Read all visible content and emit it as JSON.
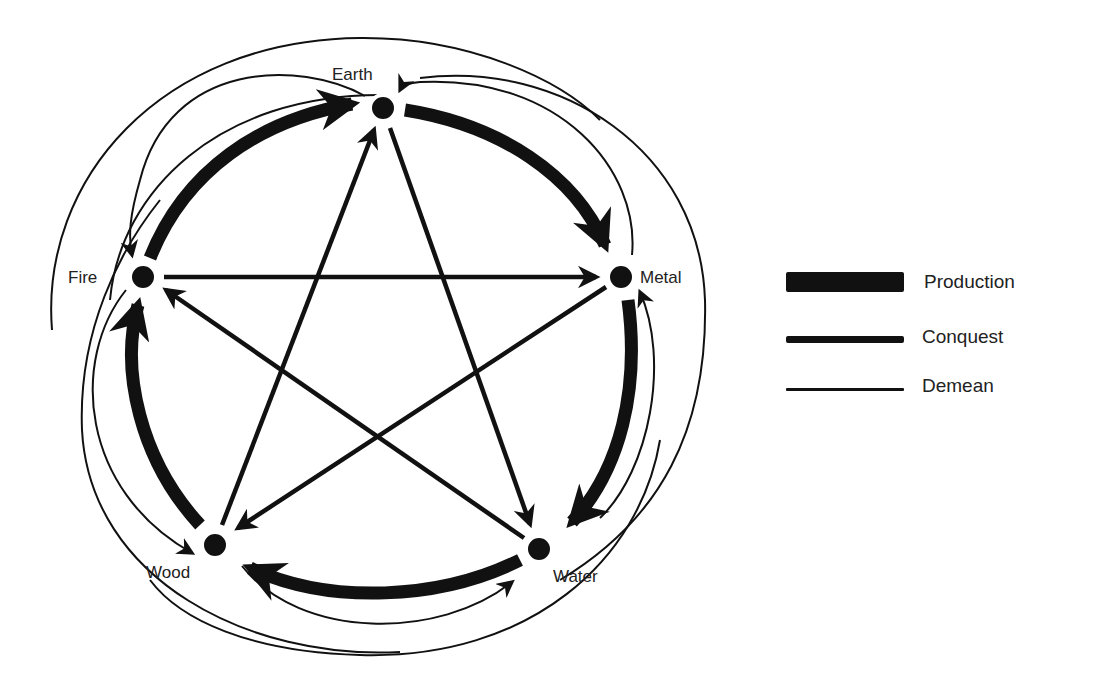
{
  "diagram": {
    "nodes": [
      {
        "id": "earth",
        "label": "Earth",
        "x": 383,
        "y": 108
      },
      {
        "id": "metal",
        "label": "Metal",
        "x": 621,
        "y": 277
      },
      {
        "id": "water",
        "label": "Water",
        "x": 539,
        "y": 549
      },
      {
        "id": "wood",
        "label": "Wood",
        "x": 215,
        "y": 545
      },
      {
        "id": "fire",
        "label": "Fire",
        "x": 143,
        "y": 277
      }
    ],
    "edges": {
      "production": [
        {
          "from": "Earth",
          "to": "Metal"
        },
        {
          "from": "Metal",
          "to": "Water"
        },
        {
          "from": "Water",
          "to": "Wood"
        },
        {
          "from": "Wood",
          "to": "Fire"
        },
        {
          "from": "Fire",
          "to": "Earth"
        }
      ],
      "conquest": [
        {
          "from": "Earth",
          "to": "Water"
        },
        {
          "from": "Water",
          "to": "Fire"
        },
        {
          "from": "Fire",
          "to": "Metal"
        },
        {
          "from": "Metal",
          "to": "Wood"
        },
        {
          "from": "Wood",
          "to": "Earth"
        }
      ],
      "demean": [
        {
          "from": "Earth",
          "to": "Fire"
        },
        {
          "from": "Fire",
          "to": "Wood"
        },
        {
          "from": "Wood",
          "to": "Water"
        },
        {
          "from": "Water",
          "to": "Metal"
        },
        {
          "from": "Metal",
          "to": "Earth"
        }
      ]
    }
  },
  "legend": {
    "items": [
      {
        "label": "Production",
        "style": "thick"
      },
      {
        "label": "Conquest",
        "style": "medium"
      },
      {
        "label": "Demean",
        "style": "thin"
      }
    ]
  },
  "colors": {
    "ink": "#111111",
    "background": "#ffffff"
  }
}
